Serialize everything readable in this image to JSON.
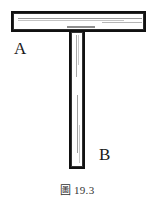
{
  "figure": {
    "caption_label": "圖",
    "caption_number": "19.3",
    "caption_full": "圖 19.3",
    "background_color": "#ffffff",
    "outline_color": "#111111",
    "hatch_color": "#9a9a9a",
    "label_color": "#1a1a1a",
    "shape": "inverted-T",
    "parts": [
      {
        "id": "A",
        "label": "A",
        "name": "horizontal-bar",
        "orientation": "horizontal"
      },
      {
        "id": "B",
        "label": "B",
        "name": "vertical-bar",
        "orientation": "vertical"
      }
    ]
  }
}
